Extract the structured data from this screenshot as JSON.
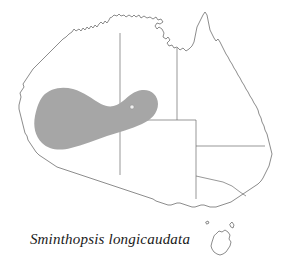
{
  "figure": {
    "type": "distribution-map",
    "region": "Australia",
    "caption": "Sminthopsis longicaudata",
    "background_color": "#ffffff"
  },
  "map": {
    "coastline_color": "#5a5a5a",
    "land_fill": "#ffffff",
    "state_border_color": "#6b6b6b",
    "labels": {
      "mainland": "Australia mainland",
      "island": "Tasmania"
    }
  },
  "range": {
    "label": "Distribution range",
    "fill_color": "#a6a6a6",
    "description": "Crescent band across the arid interior of Western Australia extending into the Northern Territory and South Australia border junction"
  },
  "record": {
    "label": "Record locality",
    "marker_color": "#efefef",
    "marker_shape": "dot"
  },
  "borders": [
    {
      "name": "wa-nt-sa-vertical",
      "label": "Western Australia / Northern Territory border"
    },
    {
      "name": "nt-sa-horizontal",
      "label": "Northern Territory / South Australia border"
    },
    {
      "name": "nt-qld-vertical",
      "label": "Northern Territory / Queensland border"
    },
    {
      "name": "sa-nsw-qld",
      "label": "South Australia / New South Wales border"
    },
    {
      "name": "sa-vic",
      "label": "South Australia / Victoria border"
    },
    {
      "name": "nsw-vic",
      "label": "New South Wales / Victoria border"
    }
  ]
}
